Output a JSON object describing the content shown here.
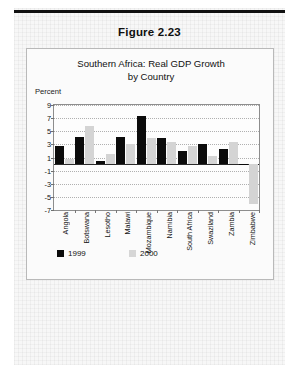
{
  "figure": {
    "label": "Figure 2.23"
  },
  "chart_card": {
    "title_line1": "Southern Africa: Real GDP Growth",
    "title_line2": "by Country",
    "percent_label": "Percent"
  },
  "legend": {
    "items": [
      {
        "label": "1999",
        "color": "#0b0b0b"
      },
      {
        "label": "2000",
        "color": "#d6d6d6"
      }
    ]
  },
  "chart_data": {
    "type": "bar",
    "title": "Southern Africa: Real GDP Growth by Country",
    "xlabel": "",
    "ylabel": "Percent",
    "ylim": [
      -7,
      9
    ],
    "yticks": [
      9,
      7,
      5,
      3,
      1,
      -1,
      -3,
      -5,
      -7
    ],
    "grid": true,
    "legend_position": "bottom-left",
    "categories": [
      "Angola",
      "Botswana",
      "Lesotho",
      "Malawi",
      "Mozambique",
      "Namibia",
      "South Africa",
      "Swaziland",
      "Zambia",
      "Zimbabwe"
    ],
    "series": [
      {
        "name": "1999",
        "color": "#0b0b0b",
        "values": [
          2.7,
          4.1,
          0.5,
          4.1,
          7.4,
          3.9,
          2.0,
          3.1,
          2.3,
          -0.1
        ]
      },
      {
        "name": "2000",
        "color": "#d6d6d6",
        "values": [
          0.8,
          5.8,
          1.5,
          3.0,
          3.9,
          3.3,
          2.7,
          1.2,
          3.4,
          -6.1
        ]
      }
    ]
  }
}
